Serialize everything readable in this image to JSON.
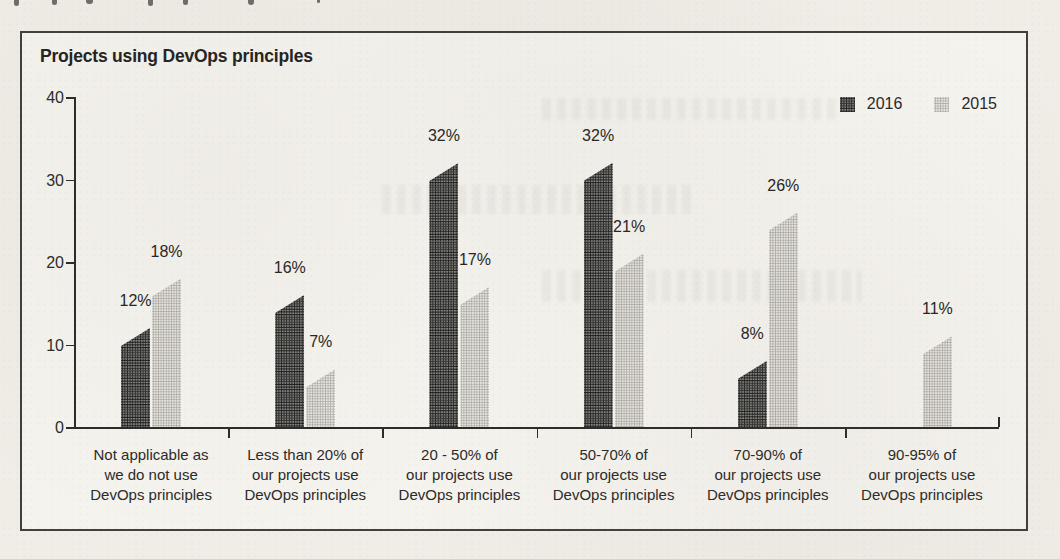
{
  "page": {
    "background_color": "#f0ede7",
    "frame_border_color": "#413f3c"
  },
  "chart_data": {
    "type": "bar",
    "title": "Projects using DevOps principles",
    "categories": [
      "Not applicable as\nwe do not use\nDevOps principles",
      "Less than 20% of\nour projects use\nDevOps principles",
      "20 - 50% of\nour projects use\nDevOps principles",
      "50-70% of\nour projects use\nDevOps principles",
      "70-90% of\nour projects use\nDevOps principles",
      "90-95% of\nour projects use\nDevOps principles"
    ],
    "series": [
      {
        "name": "2016",
        "color": "#565654",
        "values": [
          12,
          16,
          32,
          32,
          8,
          null
        ],
        "labels": [
          "12%",
          "16%",
          "32%",
          "32%",
          "8%",
          null
        ]
      },
      {
        "name": "2015",
        "color": "#d3d1cb",
        "values": [
          18,
          7,
          17,
          21,
          26,
          11
        ],
        "labels": [
          "18%",
          "7%",
          "17%",
          "21%",
          "26%",
          "11%"
        ]
      }
    ],
    "xlabel": "",
    "ylabel": "",
    "ylim": [
      0,
      40
    ],
    "yticks": [
      0,
      10,
      20,
      30,
      40
    ],
    "grid": false,
    "legend_position": "top-right",
    "bar_style": "slanted-peak-top"
  }
}
